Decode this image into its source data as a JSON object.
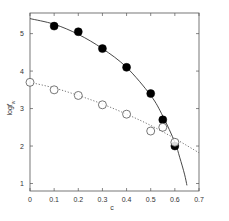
{
  "chart_data": {
    "type": "scatter",
    "title": "",
    "xlabel": "c",
    "ylabel": "log f_w",
    "xlim": [
      0,
      0.7
    ],
    "ylim": [
      0.8,
      5.55
    ],
    "xticks": [
      0,
      0.1,
      0.2,
      0.3,
      0.4,
      0.5,
      0.6,
      0.7
    ],
    "xtick_labels": [
      "0",
      "0.1",
      "0.2",
      "0.3",
      "0.4",
      "0.5",
      "0.6",
      "0.7"
    ],
    "yticks": [
      1,
      2,
      3,
      4,
      5
    ],
    "ytick_labels": [
      "1",
      "2",
      "3",
      "4",
      "5"
    ],
    "grid": false,
    "legend": null,
    "series": [
      {
        "name": "filled circles",
        "marker": "filled-circle",
        "x": [
          0.1,
          0.2,
          0.3,
          0.4,
          0.5,
          0.55,
          0.6
        ],
        "y": [
          5.2,
          5.05,
          4.6,
          4.1,
          3.4,
          2.7,
          2.0
        ],
        "fit_line": "solid",
        "fit_x": [
          0,
          0.1,
          0.2,
          0.3,
          0.4,
          0.5,
          0.55,
          0.6,
          0.62,
          0.64,
          0.65
        ],
        "fit_y": [
          5.4,
          5.25,
          4.98,
          4.6,
          4.1,
          3.35,
          2.8,
          2.1,
          1.7,
          1.25,
          0.95
        ]
      },
      {
        "name": "open circles",
        "marker": "open-circle",
        "x": [
          0,
          0.1,
          0.2,
          0.3,
          0.4,
          0.5,
          0.55,
          0.6
        ],
        "y": [
          3.7,
          3.5,
          3.35,
          3.1,
          2.85,
          2.4,
          2.5,
          2.1
        ],
        "fit_line": "dotted",
        "fit_x": [
          0,
          0.1,
          0.2,
          0.3,
          0.4,
          0.5,
          0.6,
          0.7
        ],
        "fit_y": [
          3.7,
          3.55,
          3.35,
          3.12,
          2.85,
          2.55,
          2.2,
          1.82
        ]
      }
    ]
  }
}
